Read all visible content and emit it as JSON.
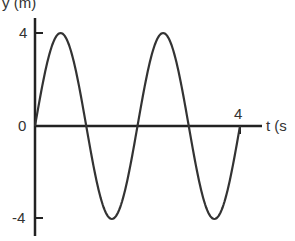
{
  "chart_data": {
    "type": "line",
    "title": "",
    "xlabel": "t (s)",
    "ylabel": "y (m)",
    "xlim": [
      0,
      4
    ],
    "ylim": [
      -4,
      4
    ],
    "x_ticks": [
      "4"
    ],
    "y_ticks": [
      "4",
      "0",
      "-4"
    ],
    "grid": false,
    "legend": null,
    "series": [
      {
        "name": "y(t) = 4 sin(πt)",
        "x": [
          0,
          0.5,
          1,
          1.5,
          2,
          2.5,
          3,
          3.5,
          4
        ],
        "values": [
          0,
          4,
          0,
          -4,
          0,
          4,
          0,
          -4,
          0
        ]
      }
    ]
  },
  "labels": {
    "y_axis": "y (m)",
    "x_axis": "t (s",
    "y_tick_top": "4",
    "y_tick_zero": "0",
    "y_tick_bottom": "-4",
    "x_tick_4": "4"
  }
}
